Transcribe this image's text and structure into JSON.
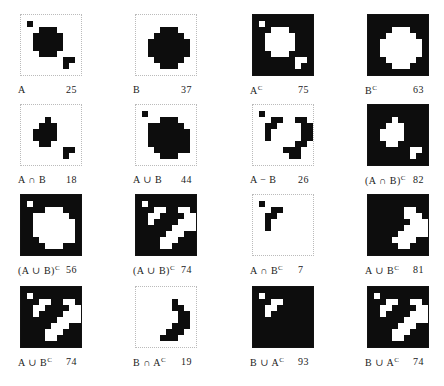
{
  "figure": {
    "grid_size": 10,
    "panels": [
      {
        "id": "A",
        "label": "A",
        "count": "25",
        "dark": false,
        "rows": [
          "0000000000",
          "0100000000",
          "0001110000",
          "0011111000",
          "0011111000",
          "0011111000",
          "0001110000",
          "0000000110",
          "0000000100",
          "0000000000"
        ]
      },
      {
        "id": "B",
        "label": "B",
        "count": "37",
        "dark": false,
        "rows": [
          "0000000000",
          "0000000000",
          "0000111000",
          "0001111100",
          "0011111110",
          "0011111110",
          "0011111110",
          "0001111100",
          "0000111000",
          "0000000000"
        ]
      },
      {
        "id": "Ac",
        "label": "A",
        "sup": "C",
        "count": "75",
        "dark": true,
        "rows": [
          "1111111111",
          "1011111111",
          "1110001111",
          "1100000111",
          "1100000111",
          "1100000111",
          "1110001111",
          "1111111001",
          "1111111011",
          "1111111111"
        ]
      },
      {
        "id": "Bc",
        "label": "B",
        "sup": "C",
        "count": "63",
        "dark": true,
        "rows": [
          "1111111111",
          "1111111111",
          "1111000111",
          "1110000011",
          "1100000001",
          "1100000001",
          "1100000001",
          "1110000011",
          "1111000111",
          "1111111111"
        ]
      },
      {
        "id": "AandB",
        "label": "A ∩ B",
        "count": "18",
        "dark": false,
        "rows": [
          "0000000000",
          "0000000000",
          "0000100000",
          "0001110000",
          "0011110000",
          "0011110000",
          "0001100000",
          "0000000110",
          "0000000100",
          "0000000000"
        ]
      },
      {
        "id": "AorB",
        "label": "A ∪ B",
        "count": "44",
        "dark": false,
        "rows": [
          "0000000000",
          "0100000000",
          "0000111000",
          "0011111100",
          "0011111110",
          "0011111110",
          "0011111110",
          "0001111110",
          "0000111000",
          "0000000000"
        ]
      },
      {
        "id": "AminusB",
        "label": "A − B",
        "count": "26",
        "dark": false,
        "rows": [
          "0000000000",
          "0100000000",
          "0001100110",
          "0011000011",
          "0010000011",
          "0010000011",
          "0000000110",
          "0000011100",
          "0000001100",
          "0000000000"
        ]
      },
      {
        "id": "notAandB",
        "label": "(A ∩ B)",
        "sup": "C",
        "count": "82",
        "dark": true,
        "rows": [
          "1111111111",
          "1111111111",
          "1111011111",
          "1110001111",
          "1100001111",
          "1100001111",
          "1110011111",
          "1111111001",
          "1111111011",
          "1111111111"
        ]
      },
      {
        "id": "notAorB",
        "label": "(A ∪ B)",
        "sup": "C",
        "count": "56",
        "dark": true,
        "rows": [
          "1111111111",
          "1011111111",
          "1111000111",
          "1100000011",
          "1100000001",
          "1100000001",
          "1100000001",
          "1110000001",
          "1111000111",
          "1111111111"
        ]
      },
      {
        "id": "notAorB2",
        "label": "(A ∪ B)",
        "sup": "C",
        "count": "74",
        "dark": true,
        "rows": [
          "1111111111",
          "1011111111",
          "1110011001",
          "1100111100",
          "1101111000",
          "1111110000",
          "1111100011",
          "1111000111",
          "1111001111",
          "1111111111"
        ]
      },
      {
        "id": "AandBc",
        "label": "A ∩ B",
        "sup": "C",
        "count": "7",
        "dark": false,
        "rows": [
          "0000000000",
          "0100000000",
          "0001100000",
          "0011000000",
          "0010000000",
          "0010000000",
          "0000000000",
          "0000000000",
          "0000000000",
          "0000000000"
        ]
      },
      {
        "id": "AorBc",
        "label": "A ∪ B",
        "sup": "C",
        "count": "81",
        "dark": true,
        "rows": [
          "1111111111",
          "1111111111",
          "1111110011",
          "1111110001",
          "1111111000",
          "1111110000",
          "1111100000",
          "1111000011",
          "1111100111",
          "1111111111"
        ]
      },
      {
        "id": "AorBc2",
        "label": "A ∪ B",
        "sup": "C",
        "count": "74",
        "dark": true,
        "rows": [
          "1111111111",
          "1011111111",
          "1110011001",
          "1100111100",
          "1101111000",
          "1111110000",
          "1111100011",
          "1111000111",
          "1111001111",
          "1111111111"
        ]
      },
      {
        "id": "BandAc",
        "label": "B ∩ A",
        "sup": "C",
        "count": "19",
        "dark": false,
        "rows": [
          "0000000000",
          "0000000000",
          "0000001000",
          "0000001100",
          "0000000110",
          "0000000110",
          "0000001110",
          "0000011100",
          "0000111000",
          "0000000000"
        ]
      },
      {
        "id": "BorAc",
        "label": "B ∪ A",
        "sup": "C",
        "count": "93",
        "dark": true,
        "rows": [
          "1111111111",
          "1011111111",
          "1110011111",
          "1100111111",
          "1101111111",
          "1111111111",
          "1111111111",
          "1111111111",
          "1111111111",
          "1111111111"
        ]
      },
      {
        "id": "BorAc2",
        "label": "B ∪ A",
        "sup": "C",
        "count": "74",
        "dark": true,
        "rows": [
          "1111111111",
          "1011111111",
          "1110011001",
          "1100111100",
          "1101111000",
          "1111110000",
          "1111100011",
          "1111000111",
          "1111001111",
          "1111111111"
        ]
      }
    ]
  }
}
